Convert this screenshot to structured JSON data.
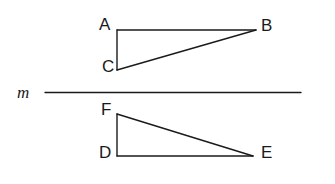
{
  "figure": {
    "type": "geometry-diagram",
    "background_color": "#ffffff",
    "stroke_color": "#1a1a1a",
    "line_m": {
      "label": "m",
      "label_style": "italic",
      "x1": 45,
      "y1": 92,
      "x2": 301,
      "y2": 92
    },
    "triangles": [
      {
        "name": "triangle-ABC",
        "position": "above-line",
        "vertices": [
          {
            "label": "A",
            "x": 117,
            "y": 30
          },
          {
            "label": "B",
            "x": 256,
            "y": 30
          },
          {
            "label": "C",
            "x": 117,
            "y": 70
          }
        ]
      },
      {
        "name": "triangle-FDE",
        "position": "below-line",
        "vertices": [
          {
            "label": "F",
            "x": 117,
            "y": 114
          },
          {
            "label": "D",
            "x": 117,
            "y": 156
          },
          {
            "label": "E",
            "x": 253,
            "y": 156
          }
        ]
      }
    ],
    "labels": {
      "A": "A",
      "B": "B",
      "C": "C",
      "D": "D",
      "E": "E",
      "F": "F",
      "m": "m"
    }
  }
}
